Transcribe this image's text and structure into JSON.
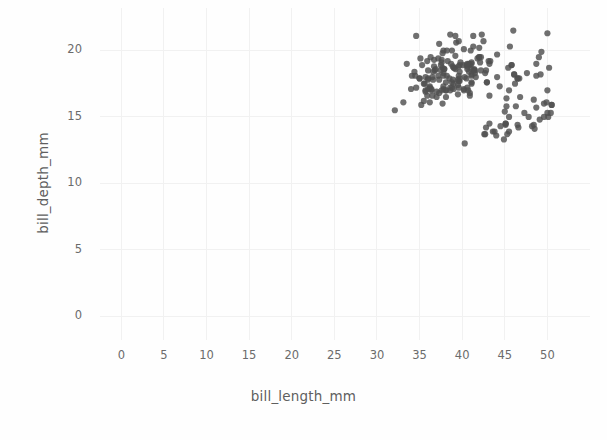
{
  "chart_data": {
    "type": "scatter",
    "title": "",
    "xlabel": "bill_length_mm",
    "ylabel": "bill_depth_mm",
    "xlim": [
      -2.5,
      55
    ],
    "ylim": [
      -1.8,
      23.2
    ],
    "xticks": [
      0,
      5,
      10,
      15,
      20,
      25,
      30,
      35,
      40,
      45,
      50
    ],
    "xtick_labels": [
      "0",
      "5",
      "10",
      "15",
      "20",
      "25",
      "30",
      "35",
      "40",
      "45",
      "50"
    ],
    "yticks": [
      0,
      5,
      10,
      15,
      20
    ],
    "ytick_labels": [
      "0",
      "5",
      "10",
      "15",
      "20"
    ],
    "grid": true,
    "grid_color": "#f1f1f1",
    "background_color": "#fefefe",
    "marker_color": "#4f4f4f",
    "marker_opacity": 0.82,
    "marker_size": 5,
    "legend": null,
    "n_points": 214,
    "x_range_observed": [
      32.1,
      46.5
    ],
    "y_range_observed": [
      15.5,
      21.9
    ],
    "points": [
      [
        39.1,
        18.7
      ],
      [
        39.5,
        17.4
      ],
      [
        40.3,
        18.0
      ],
      [
        36.7,
        19.3
      ],
      [
        39.3,
        20.6
      ],
      [
        38.9,
        17.8
      ],
      [
        39.2,
        19.6
      ],
      [
        34.1,
        18.1
      ],
      [
        42.0,
        20.2
      ],
      [
        37.8,
        17.1
      ],
      [
        37.8,
        17.3
      ],
      [
        41.1,
        17.6
      ],
      [
        38.6,
        21.2
      ],
      [
        34.6,
        21.1
      ],
      [
        36.6,
        17.8
      ],
      [
        38.7,
        19.0
      ],
      [
        42.5,
        20.7
      ],
      [
        34.4,
        18.4
      ],
      [
        46.0,
        21.5
      ],
      [
        37.8,
        18.3
      ],
      [
        37.7,
        18.7
      ],
      [
        35.9,
        19.2
      ],
      [
        38.2,
        18.1
      ],
      [
        38.8,
        17.2
      ],
      [
        35.3,
        18.9
      ],
      [
        40.6,
        18.6
      ],
      [
        40.5,
        17.9
      ],
      [
        37.9,
        18.6
      ],
      [
        40.5,
        18.9
      ],
      [
        39.5,
        16.7
      ],
      [
        37.2,
        18.1
      ],
      [
        39.5,
        17.8
      ],
      [
        40.9,
        18.9
      ],
      [
        36.4,
        17.0
      ],
      [
        39.2,
        21.1
      ],
      [
        38.8,
        20.0
      ],
      [
        42.2,
        18.5
      ],
      [
        37.6,
        19.3
      ],
      [
        39.8,
        19.1
      ],
      [
        36.5,
        18.0
      ],
      [
        40.8,
        18.4
      ],
      [
        36.0,
        18.5
      ],
      [
        44.1,
        19.7
      ],
      [
        37.0,
        16.9
      ],
      [
        39.6,
        18.8
      ],
      [
        41.1,
        19.0
      ],
      [
        37.5,
        18.9
      ],
      [
        36.0,
        17.9
      ],
      [
        42.3,
        21.2
      ],
      [
        39.6,
        17.7
      ],
      [
        40.1,
        18.9
      ],
      [
        35.0,
        17.9
      ],
      [
        42.0,
        19.5
      ],
      [
        34.5,
        18.1
      ],
      [
        41.4,
        18.6
      ],
      [
        39.0,
        17.5
      ],
      [
        40.6,
        18.8
      ],
      [
        36.5,
        16.6
      ],
      [
        37.6,
        19.1
      ],
      [
        35.7,
        16.9
      ],
      [
        41.3,
        21.1
      ],
      [
        37.6,
        17.0
      ],
      [
        41.1,
        18.2
      ],
      [
        36.4,
        17.1
      ],
      [
        41.6,
        18.0
      ],
      [
        35.5,
        16.2
      ],
      [
        41.1,
        19.1
      ],
      [
        35.9,
        16.6
      ],
      [
        41.8,
        19.4
      ],
      [
        33.5,
        19.0
      ],
      [
        39.7,
        18.4
      ],
      [
        39.6,
        17.2
      ],
      [
        45.8,
        18.9
      ],
      [
        35.5,
        17.5
      ],
      [
        42.8,
        18.5
      ],
      [
        40.9,
        16.8
      ],
      [
        37.2,
        19.4
      ],
      [
        36.2,
        16.1
      ],
      [
        42.1,
        19.1
      ],
      [
        34.6,
        17.2
      ],
      [
        42.9,
        17.6
      ],
      [
        36.7,
        18.8
      ],
      [
        35.1,
        19.4
      ],
      [
        37.3,
        17.8
      ],
      [
        41.3,
        20.3
      ],
      [
        36.3,
        19.5
      ],
      [
        36.9,
        18.6
      ],
      [
        38.3,
        19.2
      ],
      [
        38.9,
        18.8
      ],
      [
        35.7,
        18.0
      ],
      [
        41.1,
        18.1
      ],
      [
        34.0,
        17.1
      ],
      [
        39.6,
        18.1
      ],
      [
        36.2,
        17.3
      ],
      [
        40.8,
        19.0
      ],
      [
        38.1,
        17.0
      ],
      [
        40.3,
        13.0
      ],
      [
        33.1,
        16.1
      ],
      [
        43.2,
        16.6
      ],
      [
        35.0,
        17.9
      ],
      [
        41.0,
        20.0
      ],
      [
        37.7,
        16.0
      ],
      [
        37.8,
        20.0
      ],
      [
        37.9,
        18.6
      ],
      [
        39.7,
        18.9
      ],
      [
        38.6,
        17.2
      ],
      [
        38.2,
        20.0
      ],
      [
        38.1,
        17.0
      ],
      [
        43.2,
        19.0
      ],
      [
        38.1,
        16.5
      ],
      [
        45.6,
        20.3
      ],
      [
        39.7,
        17.7
      ],
      [
        42.2,
        19.5
      ],
      [
        39.6,
        20.7
      ],
      [
        42.7,
        18.3
      ],
      [
        38.6,
        17.0
      ],
      [
        37.3,
        20.5
      ],
      [
        35.7,
        17.0
      ],
      [
        41.1,
        18.6
      ],
      [
        36.2,
        17.2
      ],
      [
        37.7,
        19.8
      ],
      [
        40.2,
        17.0
      ],
      [
        41.4,
        18.5
      ],
      [
        35.2,
        15.9
      ],
      [
        40.6,
        19.0
      ],
      [
        38.8,
        17.6
      ],
      [
        41.5,
        18.3
      ],
      [
        39.0,
        17.1
      ],
      [
        44.1,
        18.0
      ],
      [
        38.5,
        17.9
      ],
      [
        43.1,
        19.2
      ],
      [
        36.8,
        18.5
      ],
      [
        37.5,
        18.5
      ],
      [
        38.1,
        17.6
      ],
      [
        41.1,
        17.5
      ],
      [
        35.6,
        17.5
      ],
      [
        40.2,
        20.1
      ],
      [
        37.0,
        16.5
      ],
      [
        39.7,
        17.9
      ],
      [
        40.2,
        17.1
      ],
      [
        40.6,
        17.2
      ],
      [
        32.1,
        15.5
      ],
      [
        40.7,
        17.0
      ],
      [
        37.3,
        16.8
      ],
      [
        39.0,
        18.7
      ],
      [
        39.2,
        18.6
      ],
      [
        36.6,
        18.4
      ],
      [
        36.0,
        17.8
      ],
      [
        37.8,
        18.1
      ],
      [
        36.0,
        17.1
      ],
      [
        41.5,
        18.5
      ],
      [
        46.1,
        18.2
      ],
      [
        50.0,
        21.3
      ],
      [
        48.7,
        18.1
      ],
      [
        50.0,
        17.0
      ],
      [
        47.6,
        18.3
      ],
      [
        46.5,
        17.9
      ],
      [
        45.4,
        18.7
      ],
      [
        46.7,
        17.9
      ],
      [
        43.3,
        19.2
      ],
      [
        46.8,
        16.5
      ],
      [
        40.9,
        16.6
      ],
      [
        49.0,
        19.5
      ],
      [
        45.5,
        17.0
      ],
      [
        48.4,
        16.3
      ],
      [
        45.8,
        18.9
      ],
      [
        49.3,
        19.9
      ],
      [
        42.0,
        19.5
      ],
      [
        49.2,
        18.2
      ],
      [
        46.2,
        17.5
      ],
      [
        48.7,
        19.0
      ],
      [
        50.2,
        18.7
      ],
      [
        45.1,
        14.5
      ],
      [
        46.5,
        17.9
      ],
      [
        46.3,
        15.8
      ],
      [
        42.9,
        17.6
      ],
      [
        46.1,
        18.2
      ],
      [
        44.5,
        14.3
      ],
      [
        47.8,
        15.0
      ],
      [
        48.2,
        14.3
      ],
      [
        50.0,
        15.3
      ],
      [
        47.3,
        15.3
      ],
      [
        42.8,
        14.2
      ],
      [
        45.1,
        14.5
      ],
      [
        59.6,
        17.0
      ],
      [
        49.1,
        14.8
      ],
      [
        48.4,
        14.4
      ],
      [
        42.6,
        13.7
      ],
      [
        44.4,
        17.3
      ],
      [
        44.0,
        13.6
      ],
      [
        48.7,
        15.7
      ],
      [
        42.7,
        13.7
      ],
      [
        49.6,
        16.0
      ],
      [
        45.3,
        13.7
      ],
      [
        49.6,
        15.0
      ],
      [
        50.5,
        15.9
      ],
      [
        43.6,
        13.9
      ],
      [
        45.5,
        13.9
      ],
      [
        50.5,
        15.9
      ],
      [
        44.9,
        13.3
      ],
      [
        45.2,
        15.8
      ],
      [
        46.6,
        14.2
      ],
      [
        48.5,
        14.1
      ],
      [
        45.1,
        14.4
      ],
      [
        50.1,
        15.0
      ],
      [
        46.5,
        14.4
      ],
      [
        45.0,
        15.4
      ],
      [
        43.8,
        13.9
      ],
      [
        45.5,
        15.0
      ],
      [
        43.2,
        14.5
      ],
      [
        50.4,
        15.3
      ],
      [
        45.2,
        16.4
      ],
      [
        49.9,
        16.1
      ]
    ],
    "note": "Points rendered are those within the visible axes window; values in mm."
  },
  "axis": {
    "x_title": "bill_length_mm",
    "y_title": "bill_depth_mm",
    "x_ticks": [
      "0",
      "5",
      "10",
      "15",
      "20",
      "25",
      "30",
      "35",
      "40",
      "45",
      "50"
    ],
    "y_ticks": [
      "0",
      "5",
      "10",
      "15",
      "20"
    ]
  }
}
